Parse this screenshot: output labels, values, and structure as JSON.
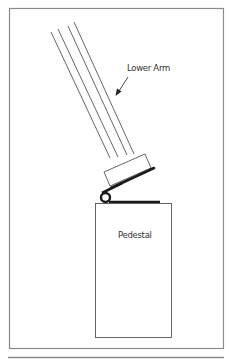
{
  "diagram": {
    "labels": {
      "lower_arm": "Lower Arm",
      "pedestal": "Pedestal"
    },
    "components": [
      "lower-arm",
      "arm-end-cap",
      "hinge",
      "pedestal"
    ],
    "colors": {
      "stroke": "#555555",
      "heavy": "#1a1a1a",
      "frame": "#777777"
    }
  }
}
